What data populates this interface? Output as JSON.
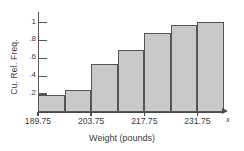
{
  "chart_data": {
    "type": "bar",
    "title": "",
    "subtitle": "",
    "xlabel": "Weight (pounds)",
    "ylabel": "Cu. Rel. Freq.",
    "x_axis_variable": "x",
    "categories": [
      "189.75-196.75",
      "196.75-203.75",
      "203.75-210.75",
      "210.75-217.75",
      "217.75-224.75",
      "224.75-231.75",
      "231.75-238.75"
    ],
    "values": [
      0.19,
      0.25,
      0.54,
      0.69,
      0.88,
      0.98,
      1.01
    ],
    "bin_edges": [
      189.75,
      196.75,
      203.75,
      210.75,
      217.75,
      224.75,
      231.75,
      238.75
    ],
    "ylim": [
      0,
      1.12
    ],
    "xlim": [
      189.75,
      238.75
    ],
    "y_ticks": [
      0.2,
      0.4,
      0.6,
      0.8,
      1.0
    ],
    "y_tick_labels": [
      ".2",
      ".4",
      ".6",
      ".8",
      "1"
    ],
    "x_ticks": [
      189.75,
      203.75,
      217.75,
      231.75
    ],
    "x_tick_labels": [
      "189.75",
      "203.75",
      "217.75",
      "231.75"
    ],
    "grid": false,
    "legend": null,
    "legend_position": "none",
    "colors": {
      "bar_fill": "#c9c9c9",
      "bar_stroke": "#555555",
      "axis": "#4a4a4a",
      "text": "#3a3a3a",
      "background": "#ffffff"
    }
  }
}
